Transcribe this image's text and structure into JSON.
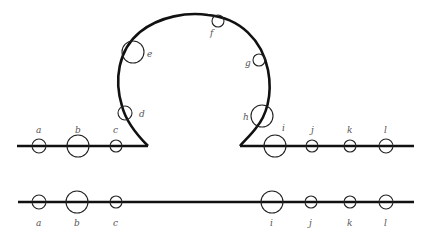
{
  "diagram": {
    "type": "loop-out illustration",
    "colors": {
      "line": "#111111",
      "marker": "#222222",
      "label": "#555555"
    },
    "top_strand": {
      "left_segment": {
        "x1": 17,
        "x2": 148,
        "y": 146
      },
      "right_segment": {
        "x1": 240,
        "x2": 414,
        "y": 146
      },
      "markers": [
        {
          "label": "a",
          "cx": 39,
          "cy": 146,
          "r": 7,
          "lx": 36,
          "ly": 133
        },
        {
          "label": "b",
          "cx": 78,
          "cy": 146,
          "r": 11,
          "lx": 75,
          "ly": 133
        },
        {
          "label": "c",
          "cx": 116,
          "cy": 146,
          "r": 6,
          "lx": 113,
          "ly": 133
        },
        {
          "label": "d",
          "cx": 125,
          "cy": 113,
          "r": 7,
          "lx": 139,
          "ly": 117
        },
        {
          "label": "e",
          "cx": 133,
          "cy": 52,
          "r": 11,
          "lx": 147,
          "ly": 57
        },
        {
          "label": "f",
          "cx": 218,
          "cy": 21,
          "r": 6,
          "lx": 210,
          "ly": 36
        },
        {
          "label": "g",
          "cx": 259,
          "cy": 60,
          "r": 6,
          "lx": 245,
          "ly": 66
        },
        {
          "label": "h",
          "cx": 262,
          "cy": 116,
          "r": 11,
          "lx": 243,
          "ly": 120
        },
        {
          "label": "i",
          "cx": 275,
          "cy": 146,
          "r": 11,
          "lx": 282,
          "ly": 131
        },
        {
          "label": "j",
          "cx": 312,
          "cy": 146,
          "r": 6,
          "lx": 311,
          "ly": 133
        },
        {
          "label": "k",
          "cx": 350,
          "cy": 146,
          "r": 6,
          "lx": 347,
          "ly": 133
        },
        {
          "label": "l",
          "cx": 386,
          "cy": 146,
          "r": 7,
          "lx": 384,
          "ly": 133
        }
      ]
    },
    "bottom_strand": {
      "segment": {
        "x1": 18,
        "x2": 414,
        "y": 202
      },
      "markers": [
        {
          "label": "a",
          "cx": 39,
          "cy": 202,
          "r": 7,
          "lx": 36,
          "ly": 226
        },
        {
          "label": "b",
          "cx": 77,
          "cy": 202,
          "r": 11,
          "lx": 74,
          "ly": 226
        },
        {
          "label": "c",
          "cx": 116,
          "cy": 202,
          "r": 6,
          "lx": 113,
          "ly": 226
        },
        {
          "label": "i",
          "cx": 272,
          "cy": 202,
          "r": 11,
          "lx": 270,
          "ly": 226
        },
        {
          "label": "j",
          "cx": 311,
          "cy": 202,
          "r": 6,
          "lx": 309,
          "ly": 226
        },
        {
          "label": "k",
          "cx": 350,
          "cy": 202,
          "r": 6,
          "lx": 347,
          "ly": 226
        },
        {
          "label": "l",
          "cx": 386,
          "cy": 202,
          "r": 7,
          "lx": 384,
          "ly": 226
        }
      ]
    }
  }
}
